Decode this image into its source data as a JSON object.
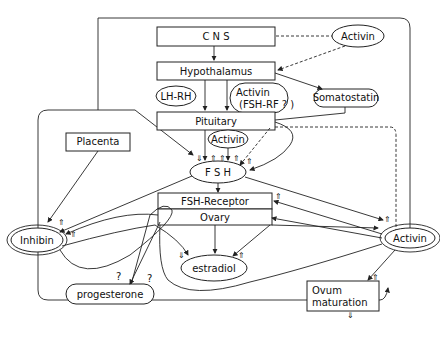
{
  "nodes": {
    "cns": "C N S",
    "activin_top": "Activin",
    "hypothalamus": "Hypothalamus",
    "lhrh": "LH-RH",
    "activin_fshrf_1": "Activin",
    "activin_fshrf_2": "(FSH-RF ? )",
    "somatostatin": "Somatostatin",
    "pituitary": "Pituitary",
    "placenta": "Placenta",
    "activin_mid": "Activin",
    "fsh": "F S H",
    "fsh_receptor": "FSH-Receptor",
    "ovary": "Ovary",
    "inhibin": "Inhibin",
    "activin_right": "Activin",
    "estradiol": "estradiol",
    "progesterone": "progesterone",
    "ovum_1": "Ovum",
    "ovum_2": "maturation"
  },
  "symbols": {
    "up": "⇑",
    "down": "⇓",
    "question": "?"
  }
}
